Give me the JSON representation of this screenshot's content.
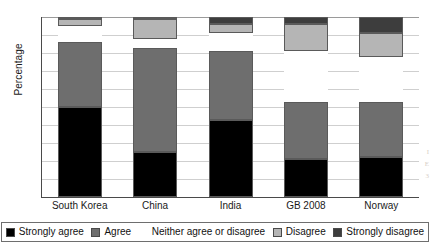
{
  "chart_data": {
    "type": "bar",
    "subtype": "stacked-bar-percentage",
    "title": "",
    "xlabel": "",
    "ylabel": "Percentage",
    "ylim": [
      0,
      100
    ],
    "ytick_step": 10,
    "yticks": [
      0,
      10,
      20,
      30,
      40,
      50,
      60,
      70,
      80,
      90,
      100
    ],
    "grid": true,
    "grid_axis": "y",
    "legend_position": "bottom",
    "categories": [
      "South Korea",
      "China",
      "India",
      "GB 2008",
      "Norway"
    ],
    "series": [
      {
        "name": "Strongly agree",
        "color": "#000000",
        "values": [
          50,
          25,
          43,
          21,
          22
        ]
      },
      {
        "name": "Agree",
        "color": "#6e6e6e",
        "values": [
          36,
          58,
          38,
          32,
          31
        ]
      },
      {
        "name": "Neither agree or disagree",
        "color": "#ffffff",
        "values": [
          9,
          5,
          10,
          28,
          25
        ]
      },
      {
        "name": "Disagree",
        "color": "#b5b5b5",
        "values": [
          4,
          11,
          5,
          15,
          13
        ]
      },
      {
        "name": "Strongly disagree",
        "color": "#3d3d3d",
        "values": [
          1,
          1,
          4,
          4,
          9
        ]
      }
    ]
  },
  "axis": {
    "y_title": "Percentage"
  },
  "legend": {
    "items": [
      {
        "label": "Strongly agree",
        "color": "#000000"
      },
      {
        "label": "Agree",
        "color": "#6e6e6e"
      },
      {
        "label": "Neither agree or disagree",
        "color": "#ffffff"
      },
      {
        "label": "Disagree",
        "color": "#b5b5b5"
      },
      {
        "label": "Strongly disagree",
        "color": "#3d3d3d"
      }
    ]
  }
}
